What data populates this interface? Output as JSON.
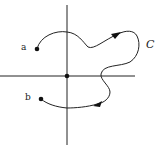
{
  "diagram": {
    "type": "path-in-plane",
    "labels": {
      "start_point": "a",
      "end_point": "b",
      "curve": "C"
    },
    "axes": {
      "horizontal": true,
      "vertical": true,
      "origin_marked": true
    },
    "colors": {
      "stroke": "#222222",
      "background": "#ffffff"
    }
  }
}
